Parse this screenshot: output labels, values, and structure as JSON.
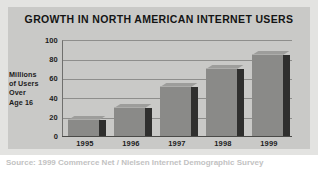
{
  "chart_data": {
    "type": "bar",
    "title": "GROWTH IN NORTH AMERICAN INTERNET USERS",
    "xlabel": "",
    "ylabel": "Millions of Users Over Age 16",
    "ylabel_lines": [
      "Millions",
      "of Users",
      "Over",
      "Age 16"
    ],
    "categories": [
      "1995",
      "1996",
      "1997",
      "1998",
      "1999"
    ],
    "values": [
      17,
      29,
      51,
      70,
      84
    ],
    "ylim": [
      0,
      100
    ],
    "yticks": [
      100,
      80,
      60,
      40,
      20,
      0
    ],
    "grid": true,
    "legend": false,
    "series": [
      {
        "name": "Millions of Users Over Age 16",
        "values": [
          17,
          29,
          51,
          70,
          84
        ]
      }
    ]
  },
  "colors": {
    "bar_front": "#8a8a88",
    "bar_side": "#2f2f2e",
    "bar_top": "#9d9d9b",
    "panel": "#c9c9c7",
    "mat": "#e3e3e1",
    "gridline": "#8e8e8c",
    "axis": "#4a4a48",
    "text": "#1c1c1c"
  },
  "footer": {
    "caption": "Source: 1999 Commerce Net / Nielsen Internet Demographic Survey"
  }
}
